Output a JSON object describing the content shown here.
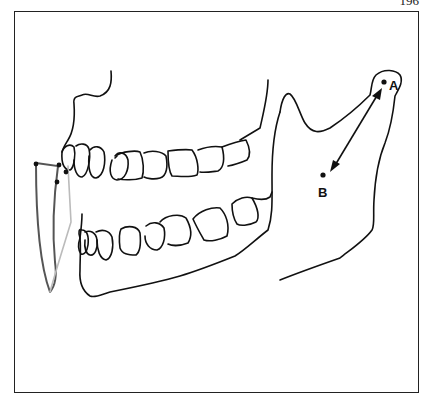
{
  "page": {
    "number": "196"
  },
  "figure": {
    "labels": {
      "point_a": "A",
      "point_b": "B"
    },
    "annotations": {
      "arrow": "double-headed arrow between A (condyle) and B",
      "incisal_tracing": "gray curved tracing lines at incisors"
    },
    "colors": {
      "line": "#111111",
      "tracing_dark": "#555555",
      "tracing_light": "#bbbbbb",
      "frame": "#222222"
    }
  }
}
